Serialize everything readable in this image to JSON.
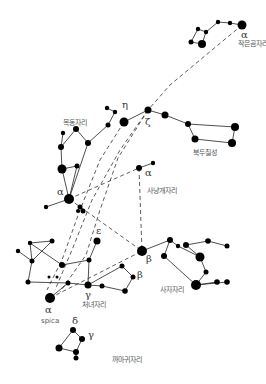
{
  "diagram": {
    "type": "star-chart",
    "constellations": [
      {
        "id": "ursa-minor",
        "label": "작은곰자리",
        "label_pos": [
          238,
          41
        ],
        "stars": [
          [
            242,
            25,
            4.5
          ],
          [
            230,
            23,
            2.2
          ],
          [
            218,
            22,
            2.2
          ],
          [
            206,
            32,
            2.2
          ],
          [
            198,
            29,
            2.2
          ],
          [
            191,
            42,
            2.5
          ],
          [
            202,
            44,
            4
          ]
        ],
        "lines": [
          [
            0,
            1
          ],
          [
            1,
            2
          ],
          [
            2,
            3
          ],
          [
            3,
            4
          ],
          [
            4,
            5
          ],
          [
            5,
            6
          ],
          [
            6,
            3
          ]
        ]
      },
      {
        "id": "big-dipper",
        "label": "북두칠성",
        "label_pos": [
          193,
          150
        ],
        "stars": [
          [
            124,
            122,
            4.5
          ],
          [
            148,
            110,
            3.5
          ],
          [
            165,
            115,
            3.5
          ],
          [
            188,
            124,
            3
          ],
          [
            235,
            127,
            4
          ],
          [
            232,
            143,
            4
          ],
          [
            195,
            139,
            3.5
          ]
        ],
        "lines": [
          [
            0,
            1
          ],
          [
            1,
            2
          ],
          [
            2,
            3
          ],
          [
            3,
            4
          ],
          [
            4,
            5
          ],
          [
            5,
            6
          ],
          [
            6,
            3
          ]
        ]
      },
      {
        "id": "bootes",
        "label": "목동자리",
        "label_pos": [
          63,
          120
        ],
        "stars": [
          [
            107,
            108,
            2.2
          ],
          [
            115,
            112,
            2.2
          ],
          [
            108,
            125,
            2.5
          ],
          [
            88,
            143,
            3
          ],
          [
            76,
            129,
            3
          ],
          [
            61,
            147,
            3
          ],
          [
            62,
            169,
            4.5
          ],
          [
            77,
            166,
            2.5
          ],
          [
            69,
            199,
            5
          ],
          [
            46,
            207,
            2.2
          ],
          [
            63,
            133,
            2.2
          ]
        ],
        "lines": [
          [
            0,
            1
          ],
          [
            1,
            2
          ],
          [
            2,
            3
          ],
          [
            3,
            4
          ],
          [
            4,
            5
          ],
          [
            5,
            6
          ],
          [
            6,
            7
          ],
          [
            7,
            8
          ],
          [
            6,
            8
          ],
          [
            8,
            9
          ],
          [
            3,
            8
          ],
          [
            5,
            10
          ]
        ]
      },
      {
        "id": "canes-venatici",
        "label": "사냥개자리",
        "label_pos": [
          147,
          188
        ],
        "stars": [
          [
            139,
            168,
            3
          ],
          [
            153,
            163,
            2.2
          ]
        ],
        "lines": [
          [
            0,
            1
          ]
        ]
      },
      {
        "id": "coma",
        "label": "",
        "label_pos": [
          0,
          0
        ],
        "stars": [
          [
            80,
            207,
            2.5
          ],
          [
            83,
            211,
            2.5
          ],
          [
            78,
            211,
            2
          ]
        ],
        "lines": []
      },
      {
        "id": "virgo",
        "label": "처녀자리",
        "label_pos": [
          82,
          302
        ],
        "stars": [
          [
            52,
            241,
            2.5
          ],
          [
            30,
            243,
            2.2
          ],
          [
            18,
            251,
            2.2
          ],
          [
            32,
            261,
            2.5
          ],
          [
            28,
            282,
            2.5
          ],
          [
            62,
            265,
            3
          ],
          [
            89,
            260,
            2.5
          ],
          [
            97,
            241,
            3.5
          ],
          [
            88,
            285,
            3.5
          ],
          [
            68,
            283,
            2.5
          ],
          [
            50,
            298,
            5
          ],
          [
            102,
            286,
            2.5
          ],
          [
            125,
            291,
            2.8
          ],
          [
            133,
            277,
            2.5
          ],
          [
            122,
            266,
            2.5
          ],
          [
            49,
            277,
            1.5
          ],
          [
            57,
            277,
            1.5
          ]
        ],
        "lines": [
          [
            0,
            1
          ],
          [
            1,
            3
          ],
          [
            0,
            3
          ],
          [
            2,
            3
          ],
          [
            3,
            4
          ],
          [
            4,
            9
          ],
          [
            9,
            8
          ],
          [
            1,
            5
          ],
          [
            5,
            6
          ],
          [
            6,
            7
          ],
          [
            6,
            8
          ],
          [
            8,
            11
          ],
          [
            11,
            12
          ],
          [
            12,
            13
          ],
          [
            13,
            14
          ],
          [
            14,
            8
          ],
          [
            9,
            10
          ]
        ]
      },
      {
        "id": "leo",
        "label": "사자자리",
        "label_pos": [
          160,
          287
        ],
        "stars": [
          [
            142,
            251,
            5
          ],
          [
            170,
            240,
            3
          ],
          [
            178,
            246,
            2.2
          ],
          [
            164,
            256,
            3
          ],
          [
            200,
            257,
            4.5
          ],
          [
            206,
            272,
            2.5
          ],
          [
            196,
            285,
            5
          ],
          [
            217,
            282,
            2.8
          ],
          [
            227,
            282,
            2.8
          ],
          [
            186,
            245,
            3
          ],
          [
            208,
            241,
            2.8
          ],
          [
            227,
            246,
            2.5
          ]
        ],
        "lines": [
          [
            0,
            1
          ],
          [
            1,
            2
          ],
          [
            2,
            4
          ],
          [
            1,
            3
          ],
          [
            3,
            6
          ],
          [
            4,
            5
          ],
          [
            5,
            6
          ],
          [
            6,
            7
          ],
          [
            6,
            8
          ],
          [
            4,
            9
          ],
          [
            9,
            10
          ],
          [
            10,
            11
          ]
        ]
      },
      {
        "id": "corvus",
        "label": "까마귀자리",
        "label_pos": [
          112,
          357
        ],
        "stars": [
          [
            73,
            330,
            3
          ],
          [
            82,
            339,
            3
          ],
          [
            76,
            352,
            3
          ],
          [
            59,
            348,
            3.5
          ],
          [
            76,
            358,
            2.5
          ]
        ],
        "lines": [
          [
            0,
            1
          ],
          [
            1,
            2
          ],
          [
            2,
            3
          ],
          [
            3,
            0
          ],
          [
            2,
            4
          ]
        ]
      }
    ],
    "dashed_lines": [
      [
        [
          242,
          25
        ],
        [
          200,
          60
        ],
        [
          170,
          85
        ],
        [
          148,
          110
        ]
      ],
      [
        [
          148,
          110
        ],
        [
          120,
          150
        ],
        [
          92,
          200
        ],
        [
          72,
          250
        ],
        [
          55,
          290
        ]
      ],
      [
        [
          124,
          122
        ],
        [
          100,
          160
        ],
        [
          80,
          210
        ],
        [
          62,
          260
        ],
        [
          47,
          290
        ]
      ],
      [
        [
          148,
          110
        ],
        [
          118,
          158
        ],
        [
          100,
          210
        ],
        [
          86,
          255
        ],
        [
          60,
          292
        ]
      ],
      [
        [
          69,
          199
        ],
        [
          139,
          168
        ]
      ],
      [
        [
          139,
          168
        ],
        [
          142,
          251
        ]
      ],
      [
        [
          69,
          199
        ],
        [
          142,
          251
        ]
      ],
      [
        [
          50,
          298
        ],
        [
          142,
          251
        ]
      ]
    ],
    "greek_labels": [
      {
        "text": "α",
        "pos": [
          241,
          30
        ],
        "note": "Ursa Minor alpha"
      },
      {
        "text": "η",
        "pos": [
          122,
          100
        ],
        "note": "Big Dipper eta"
      },
      {
        "text": "ζ",
        "pos": [
          145,
          117
        ],
        "note": "Big Dipper zeta"
      },
      {
        "text": "α",
        "pos": [
          57,
          187
        ],
        "note": "Bootes alpha"
      },
      {
        "text": "α",
        "pos": [
          145,
          168
        ],
        "note": "Canes Venatici alpha"
      },
      {
        "text": "ε",
        "pos": [
          96,
          226
        ],
        "note": "Virgo epsilon"
      },
      {
        "text": "β",
        "pos": [
          146,
          254
        ],
        "note": "Leo beta"
      },
      {
        "text": "β",
        "pos": [
          137,
          270
        ],
        "note": "Virgo beta"
      },
      {
        "text": "γ",
        "pos": [
          85,
          290
        ],
        "note": "Virgo gamma"
      },
      {
        "text": "α",
        "pos": [
          45,
          305
        ],
        "note": "Virgo alpha (Spica)"
      },
      {
        "text": "δ",
        "pos": [
          72,
          316
        ],
        "note": "Corvus delta"
      },
      {
        "text": "γ",
        "pos": [
          88,
          330
        ],
        "note": "Corvus gamma"
      }
    ],
    "extra_labels": [
      {
        "text": "spica",
        "pos": [
          41,
          318
        ]
      }
    ]
  }
}
